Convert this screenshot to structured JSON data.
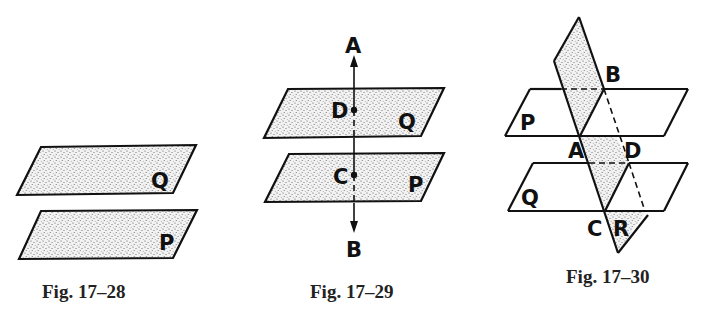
{
  "figures": [
    {
      "caption": "Fig. 17–28",
      "description": "Two parallel planes",
      "planes": [
        {
          "label": "Q"
        },
        {
          "label": "P"
        }
      ]
    },
    {
      "caption": "Fig. 17–29",
      "description": "Line AB perpendicular to two parallel planes, intersecting Q at D and P at C",
      "planes": [
        {
          "label": "Q"
        },
        {
          "label": "P"
        }
      ],
      "line_endpoints": {
        "top": "A",
        "bottom": "B"
      },
      "points": [
        "D",
        "C"
      ]
    },
    {
      "caption": "Fig. 17–30",
      "description": "Plane R intersecting two parallel planes P and Q along lines AB and CD",
      "planes": [
        {
          "label": "P"
        },
        {
          "label": "Q"
        },
        {
          "label": "R"
        }
      ],
      "points": [
        "A",
        "B",
        "C",
        "D"
      ]
    }
  ]
}
